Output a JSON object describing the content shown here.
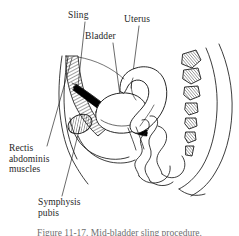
{
  "figure": {
    "kind": "anatomical-line-drawing",
    "view": "female pelvis, mid-sagittal section",
    "background_color": "#ffffff",
    "ink_color": "#1a1a1a",
    "fill_color": "#000000",
    "caption": "Figure 11-17. Mid-bladder sling procedure.",
    "labels": [
      {
        "id": "sling",
        "text": "Sling",
        "lines": [
          "Sling"
        ],
        "leader_to": "sling-band"
      },
      {
        "id": "bladder",
        "text": "Bladder",
        "lines": [
          "Bladder"
        ],
        "leader_to": "bladder-outline"
      },
      {
        "id": "uterus",
        "text": "Uterus",
        "lines": [
          "Uterus"
        ],
        "leader_to": "uterus-outline"
      },
      {
        "id": "rectis-abdominis-muscles",
        "text": "Rectis abdominis muscles",
        "lines": [
          "Rectis",
          "abdominis",
          "muscles"
        ],
        "leader_to": "rectus-hatch"
      },
      {
        "id": "symphysis-pubis",
        "text": "Symphysis pubis",
        "lines": [
          "Symphysis",
          "pubis"
        ],
        "leader_to": "pubis-bone"
      }
    ],
    "structures": [
      "rectus-abdominis-hatched-muscle",
      "symphysis-pubis-bone",
      "suburethral-sling-band",
      "bladder",
      "uterus",
      "bowel-loops",
      "sacrum-coccyx-vertebrae",
      "body-contour-anterior",
      "body-contour-posterior"
    ],
    "vertebra_count": 6
  }
}
